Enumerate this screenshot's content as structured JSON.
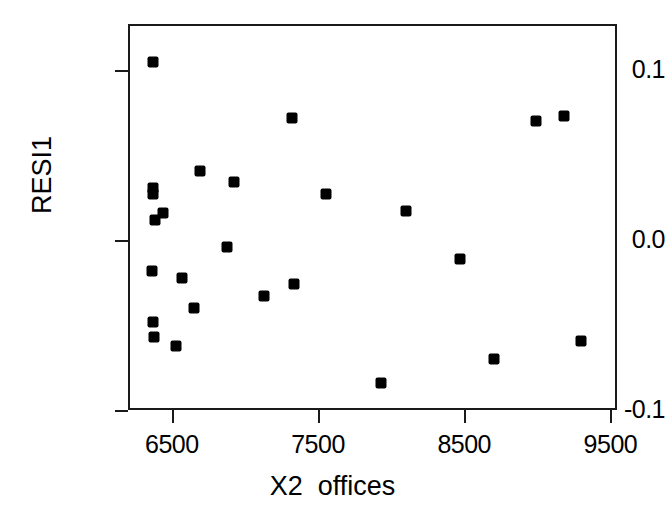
{
  "chart_data": {
    "type": "scatter",
    "title": "",
    "subtitle": "",
    "xlabel": "X2  offices",
    "ylabel": "RESI1",
    "xlim": [
      6200,
      9545
    ],
    "ylim": [
      -0.1,
      0.127
    ],
    "xticks": [
      6500,
      7500,
      8500,
      9500
    ],
    "xtick_labels": [
      "6500",
      "7500",
      "8500",
      "9500"
    ],
    "yticks": [
      0.1,
      0.0,
      -0.1
    ],
    "ytick_labels": [
      "0.1",
      "0.0",
      "-0.1"
    ],
    "grid": false,
    "legend": null,
    "marker": "filled-square",
    "marker_color": "#000000",
    "frame_color": "#1a1a1a",
    "n_points": 25,
    "x": [
      6358,
      7311,
      8980,
      9169,
      6676,
      6912,
      6358,
      6358,
      7541,
      6426,
      6372,
      8088,
      6865,
      8459,
      6351,
      6554,
      7324,
      7115,
      6635,
      6358,
      6365,
      6514,
      9284,
      8689,
      7919
    ],
    "y": [
      0.106,
      0.073,
      0.071,
      0.074,
      0.042,
      0.035,
      0.032,
      0.028,
      0.028,
      0.017,
      0.013,
      0.018,
      -0.003,
      -0.01,
      -0.017,
      -0.021,
      -0.025,
      -0.032,
      -0.039,
      -0.047,
      -0.056,
      -0.061,
      -0.058,
      -0.069,
      -0.083
    ],
    "points": [
      {
        "x": 6358,
        "y": 0.106
      },
      {
        "x": 7311,
        "y": 0.073
      },
      {
        "x": 8980,
        "y": 0.071
      },
      {
        "x": 9169,
        "y": 0.074
      },
      {
        "x": 6676,
        "y": 0.042
      },
      {
        "x": 6912,
        "y": 0.035
      },
      {
        "x": 6358,
        "y": 0.032
      },
      {
        "x": 6358,
        "y": 0.028
      },
      {
        "x": 7541,
        "y": 0.028
      },
      {
        "x": 6426,
        "y": 0.017
      },
      {
        "x": 6372,
        "y": 0.013
      },
      {
        "x": 8088,
        "y": 0.018
      },
      {
        "x": 6865,
        "y": -0.003
      },
      {
        "x": 8459,
        "y": -0.01
      },
      {
        "x": 6351,
        "y": -0.017
      },
      {
        "x": 6554,
        "y": -0.021
      },
      {
        "x": 7324,
        "y": -0.025
      },
      {
        "x": 7115,
        "y": -0.032
      },
      {
        "x": 6635,
        "y": -0.039
      },
      {
        "x": 6358,
        "y": -0.047
      },
      {
        "x": 6365,
        "y": -0.056
      },
      {
        "x": 6514,
        "y": -0.061
      },
      {
        "x": 9284,
        "y": -0.058
      },
      {
        "x": 8689,
        "y": -0.069
      },
      {
        "x": 7919,
        "y": -0.083
      }
    ]
  }
}
